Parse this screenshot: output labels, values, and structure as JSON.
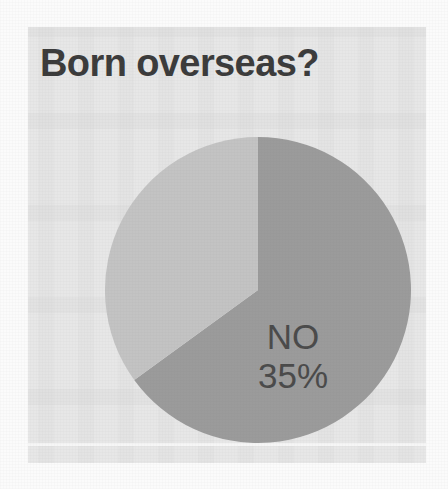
{
  "card": {
    "title": "Born overseas?",
    "background_color": "#e7e7e7",
    "title_color": "#3b3b3b"
  },
  "chart_data": {
    "type": "pie",
    "title": "Born overseas?",
    "xlabel": "",
    "ylabel": "",
    "categories": [
      "YES",
      "NO"
    ],
    "values": [
      65,
      35
    ],
    "unit": "%",
    "slices": [
      {
        "label": "YES",
        "value": 65,
        "value_text": "65%",
        "color": "#9b9b9b",
        "label_color": "#f3f3f3",
        "start_angle_deg": 0,
        "end_angle_deg": 234
      },
      {
        "label": "NO",
        "value": 35,
        "value_text": "35%",
        "color": "#c3c3c3",
        "label_color": "#4a4a4a",
        "start_angle_deg": 234,
        "end_angle_deg": 360
      }
    ],
    "legend": "none",
    "grid": false,
    "start_angle_note": "first slice begins at 12 o'clock, sweeping clockwise",
    "data_labels_inside": true
  }
}
